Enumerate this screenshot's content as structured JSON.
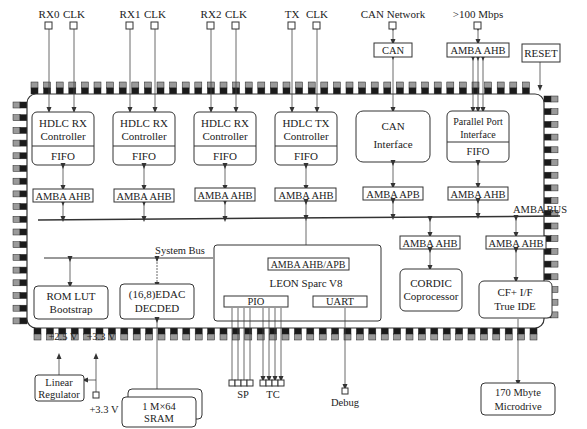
{
  "diagram": {
    "type": "block-diagram",
    "external_top": {
      "rx0": "RX0",
      "clk0": "CLK",
      "rx1": "RX1",
      "clk1": "CLK",
      "rx2": "RX2",
      "clk2": "CLK",
      "tx": "TX",
      "clk3": "CLK",
      "can_network": "CAN Network",
      "can_box": "CAN",
      "speed": ">100 Mbps",
      "amba_ext": "AMBA AHB",
      "reset": "RESET"
    },
    "modules": {
      "hdlc_rx0": {
        "line1": "HDLC RX",
        "line2": "Controller",
        "fifo": "FIFO",
        "bus": "AMBA AHB"
      },
      "hdlc_rx1": {
        "line1": "HDLC RX",
        "line2": "Controller",
        "fifo": "FIFO",
        "bus": "AMBA AHB"
      },
      "hdlc_rx2": {
        "line1": "HDLC RX",
        "line2": "Controller",
        "fifo": "FIFO",
        "bus": "AMBA AHB"
      },
      "hdlc_tx": {
        "line1": "HDLC TX",
        "line2": "Controller",
        "fifo": "FIFO",
        "bus": "AMBA AHB"
      },
      "can": {
        "line1": "CAN",
        "line2": "Interface",
        "bus": "AMBA APB"
      },
      "parallel": {
        "line1": "Parallel Port",
        "line2": "Interface",
        "fifo": "FIFO",
        "bus": "AMBA AHB"
      }
    },
    "amba_bus_label": "AMBA BUS",
    "system_bus_label": "System Bus",
    "lower": {
      "rom": {
        "line1": "ROM LUT",
        "line2": "Bootstrap"
      },
      "edac": {
        "line1": "(16,8)EDAC",
        "line2": "DECDED"
      },
      "leon": {
        "bus": "AMBA AHB/APB",
        "title": "LEON Sparc V8",
        "pio": "PIO",
        "uart": "UART"
      },
      "cordic": {
        "bus": "AMBA AHB",
        "line1": "CORDIC",
        "line2": "Coprocessor"
      },
      "cf": {
        "bus": "AMBA AHB",
        "line1": "CF+ I/F",
        "line2": "True IDE"
      }
    },
    "external_bottom": {
      "v25": "+2.5 V",
      "v33": "+3.3 V",
      "regulator_line1": "Linear",
      "regulator_line2": "Regulator",
      "v33_in": "+3.3 V",
      "sram_line1": "1 M×64",
      "sram_line2": "SRAM",
      "sp": "SP",
      "tc": "TC",
      "debug": "Debug",
      "microdrive_line1": "170 Mbyte",
      "microdrive_line2": "Microdrive"
    }
  }
}
